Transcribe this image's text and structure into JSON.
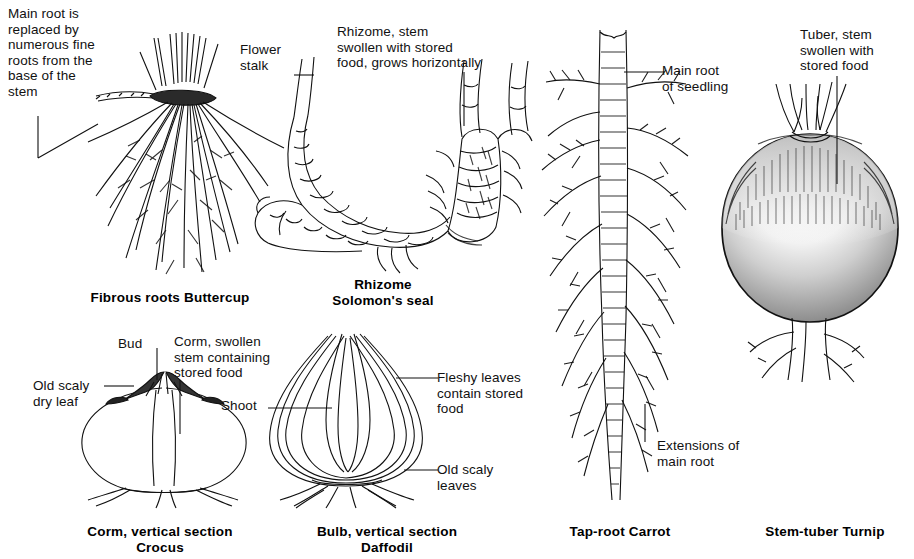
{
  "figure": {
    "background": "#ffffff",
    "ink": "#111111"
  },
  "labels": [
    {
      "id": "fibrous-note",
      "text": "Main root is\nreplaced by\nnumerous fine\nroots from the\nbase of the\nstem"
    },
    {
      "id": "flower-stalk",
      "text": "Flower\nstalk"
    },
    {
      "id": "rhizome-note",
      "text": "Rhizome, stem\nswollen with stored\nfood, grows horizontally"
    },
    {
      "id": "main-root-seedling",
      "text": "Main root\nof seedling"
    },
    {
      "id": "tuber-note",
      "text": "Tuber, stem\nswollen with\nstored food"
    },
    {
      "id": "bud",
      "text": "Bud"
    },
    {
      "id": "corm-note",
      "text": "Corm, swollen\nstem containing\nstored food"
    },
    {
      "id": "old-scaly-dry-leaf",
      "text": "Old scaly\ndry leaf"
    },
    {
      "id": "shoot",
      "text": "Shoot"
    },
    {
      "id": "fleshy-leaves",
      "text": "Fleshy leaves\ncontain stored\nfood"
    },
    {
      "id": "old-scaly-leaves",
      "text": "Old scaly\nleaves"
    },
    {
      "id": "extensions",
      "text": "Extensions of\nmain root"
    }
  ],
  "captions": [
    {
      "id": "buttercup",
      "text": "Fibrous roots Buttercup"
    },
    {
      "id": "solomons-seal",
      "text": "Rhizome\nSolomon's seal"
    },
    {
      "id": "crocus",
      "text": "Corm, vertical section\nCrocus"
    },
    {
      "id": "daffodil",
      "text": "Bulb, vertical section\nDaffodil"
    },
    {
      "id": "carrot",
      "text": "Tap-root Carrot"
    },
    {
      "id": "turnip",
      "text": "Stem-tuber Turnip"
    }
  ],
  "specimens": [
    {
      "id": "buttercup",
      "common_name": "Buttercup",
      "organ": "Fibrous roots"
    },
    {
      "id": "solomons-seal",
      "common_name": "Solomon's seal",
      "organ": "Rhizome"
    },
    {
      "id": "crocus",
      "common_name": "Crocus",
      "organ": "Corm, vertical section"
    },
    {
      "id": "daffodil",
      "common_name": "Daffodil",
      "organ": "Bulb, vertical section"
    },
    {
      "id": "carrot",
      "common_name": "Carrot",
      "organ": "Tap-root"
    },
    {
      "id": "turnip",
      "common_name": "Turnip",
      "organ": "Stem-tuber"
    }
  ]
}
